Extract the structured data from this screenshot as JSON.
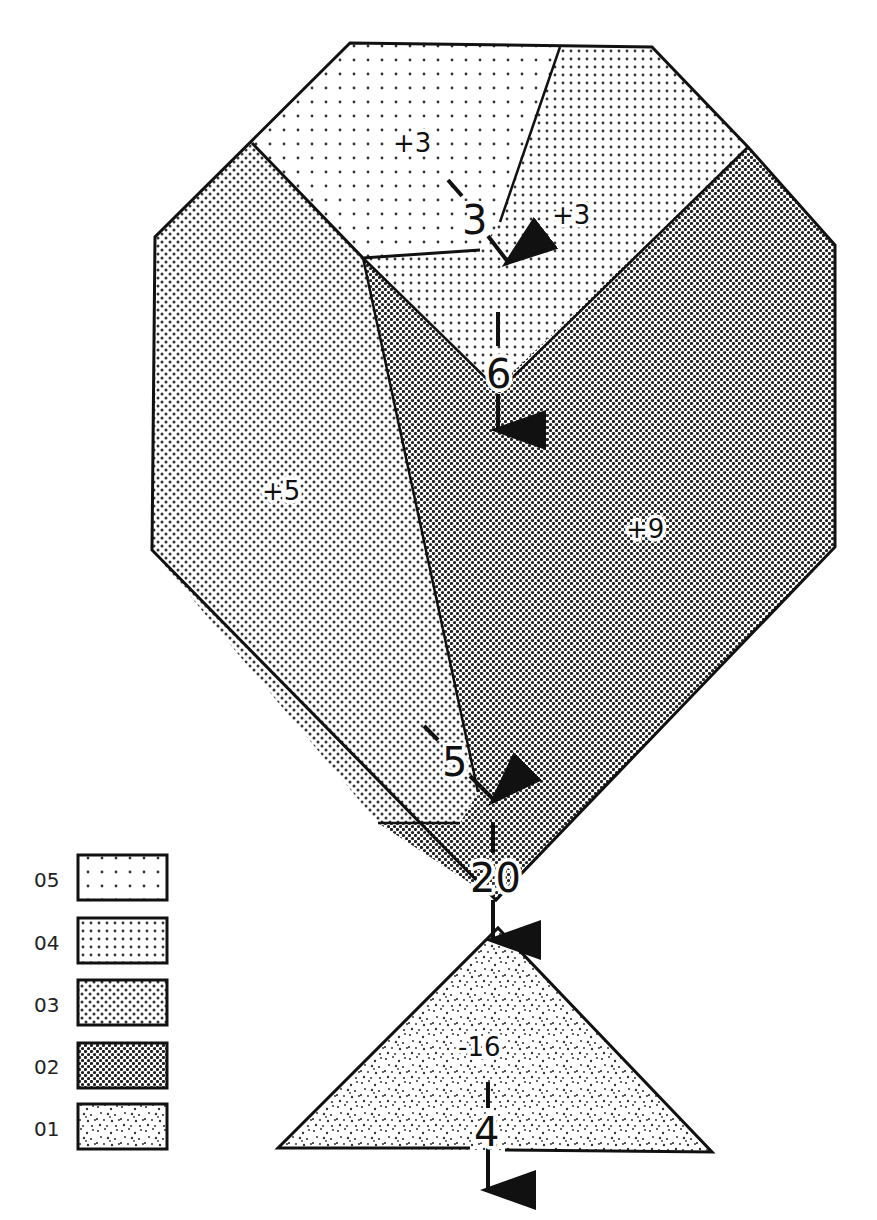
{
  "diagram": {
    "type": "flow-diagram",
    "regions": [
      {
        "id": "top-left",
        "label": "+3",
        "class": "05"
      },
      {
        "id": "top-right",
        "label": "+3",
        "class": "04"
      },
      {
        "id": "center-v",
        "label": "",
        "class": "04"
      },
      {
        "id": "left",
        "label": "+5",
        "class": "03"
      },
      {
        "id": "right",
        "label": "+9",
        "class": "02"
      },
      {
        "id": "bottom-wedge",
        "label": "",
        "class": "02"
      },
      {
        "id": "triangle",
        "label": "-16",
        "class": "01"
      }
    ],
    "flows": [
      {
        "id": "flow-a",
        "value": "3"
      },
      {
        "id": "flow-b",
        "value": "6"
      },
      {
        "id": "flow-c",
        "value": "5"
      },
      {
        "id": "flow-d",
        "value": "20"
      },
      {
        "id": "flow-e",
        "value": "4"
      }
    ]
  },
  "legend": {
    "items": [
      {
        "code": "05",
        "pattern": "sparse-dots"
      },
      {
        "code": "04",
        "pattern": "grid-dots"
      },
      {
        "code": "03",
        "pattern": "diagonal-dots"
      },
      {
        "code": "02",
        "pattern": "dense-dots"
      },
      {
        "code": "01",
        "pattern": "stipple"
      }
    ]
  },
  "colors": {
    "stroke": "#111111",
    "background": "#ffffff"
  }
}
